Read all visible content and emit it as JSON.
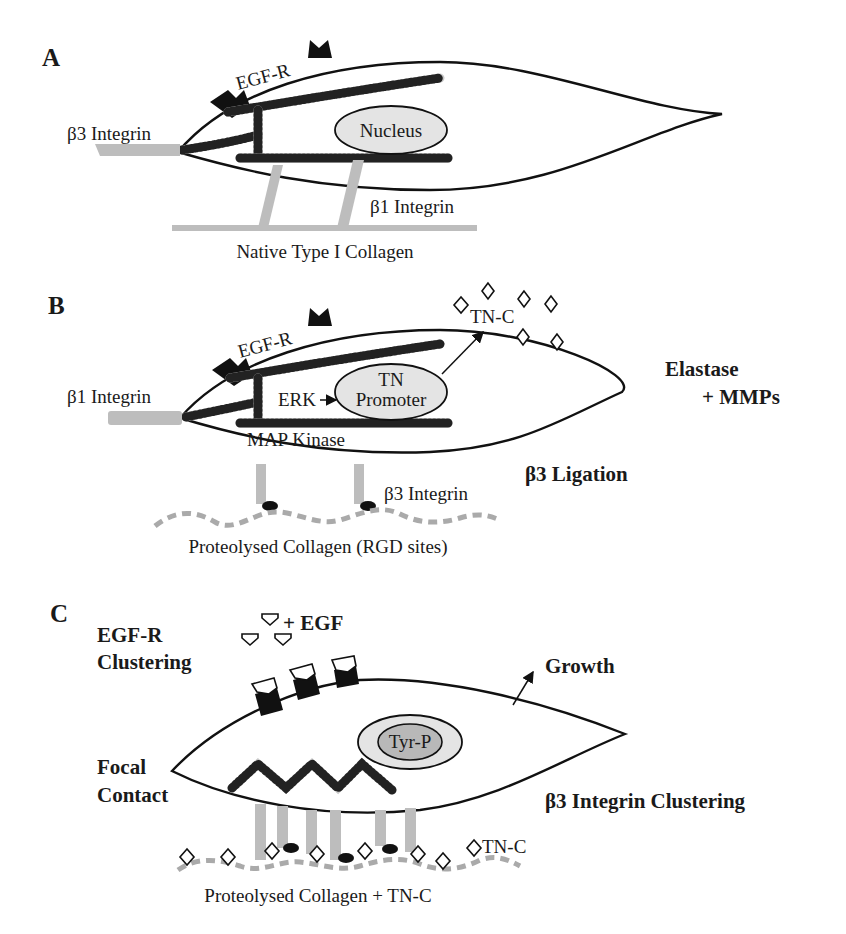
{
  "figure": {
    "panels": [
      {
        "id": "A",
        "label": "A",
        "labels": {
          "egfr": "EGF-R",
          "nucleus": "Nucleus",
          "integrin_left": "β3 Integrin",
          "integrin_bottom": "β1 Integrin",
          "substrate": "Native Type I Collagen"
        }
      },
      {
        "id": "B",
        "label": "B",
        "labels": {
          "egfr": "EGF-R",
          "nucleus_line1": "TN",
          "nucleus_line2": "Promoter",
          "erk": "ERK",
          "map_kinase": "MAP Kinase",
          "integrin_left": "β1 Integrin",
          "integrin_bottom": "β3 Integrin",
          "tnc": "TN-C",
          "enzymes_line1": "Elastase",
          "enzymes_line2": "+ MMPs",
          "ligation": "β3 Ligation",
          "substrate": "Proteolysed Collagen (RGD sites)"
        }
      },
      {
        "id": "C",
        "label": "C",
        "labels": {
          "egf": "+ EGF",
          "egfr_clustering_line1": "EGF-R",
          "egfr_clustering_line2": "Clustering",
          "growth": "Growth",
          "nucleus": "Tyr-P",
          "focal_line1": "Focal",
          "focal_line2": "Contact",
          "integrin_clustering": "β3 Integrin Clustering",
          "tnc": "TN-C",
          "substrate": "Proteolysed Collagen + TN-C"
        }
      }
    ],
    "colors": {
      "outline": "#111111",
      "integrin": "#bdbdbd",
      "nucleus_fill": "#e4e4e4",
      "receptor": "#111111"
    }
  }
}
